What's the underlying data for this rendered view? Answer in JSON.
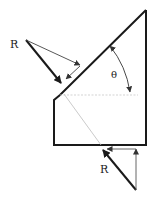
{
  "diagram": {
    "labels": {
      "force_top": "R",
      "force_bottom": "R",
      "angle": "θ"
    },
    "colors": {
      "outline": "#1a1a1a",
      "thin_line": "#555555",
      "faint_line": "#bdbdbd",
      "dashed_line": "#c8c8c8"
    }
  }
}
